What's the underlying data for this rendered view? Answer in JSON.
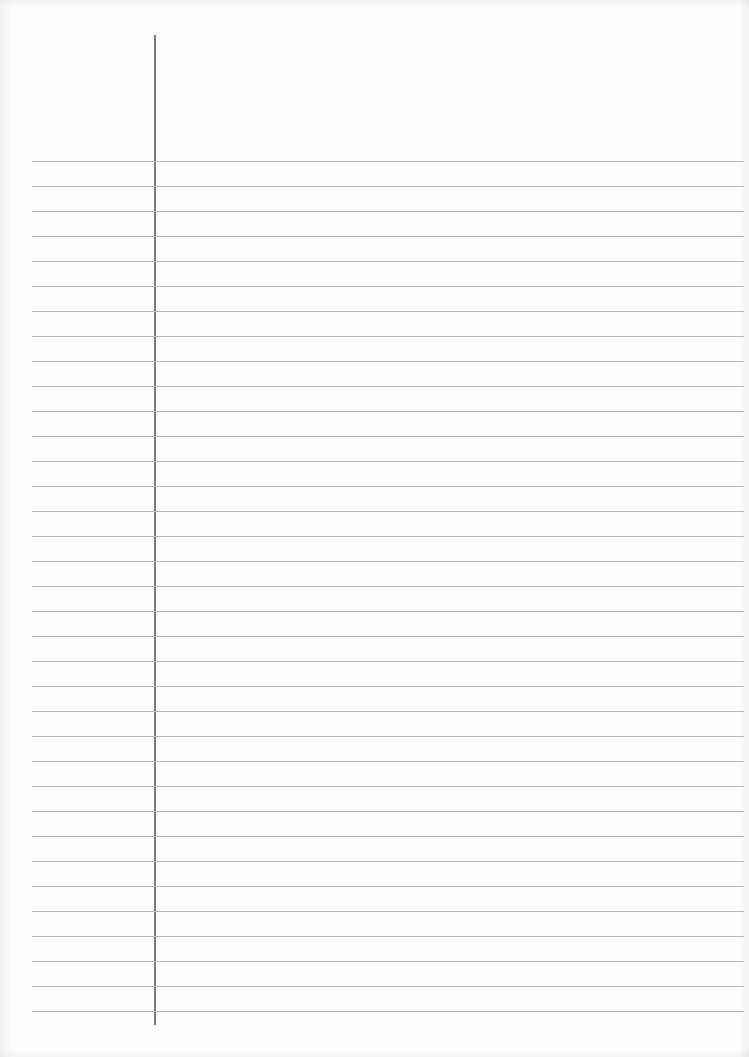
{
  "page": {
    "type": "ruled-notebook-paper",
    "background_color": "#fdfdfd",
    "rule_color": "#b8b8b8",
    "margin_line_color": "#7a7a7a",
    "rule_count": 35,
    "first_rule_y": 161,
    "rule_spacing": 25,
    "margin_line_x": 154,
    "text_content": ""
  }
}
